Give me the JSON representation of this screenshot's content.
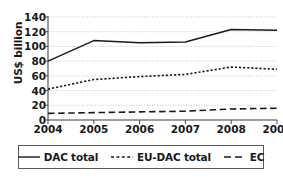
{
  "chart_data": {
    "type": "line",
    "title": "",
    "xlabel": "",
    "ylabel": "US$ billion",
    "categories": [
      "2004",
      "2005",
      "2006",
      "2007",
      "2008",
      "2009"
    ],
    "x": [
      2004,
      2005,
      2006,
      2007,
      2008,
      2009
    ],
    "ylim": [
      0,
      140
    ],
    "ytick_step": 20,
    "yticks": [
      "140",
      "120",
      "100",
      "80",
      "60",
      "40",
      "20",
      "0"
    ],
    "ytick_values": [
      140,
      120,
      100,
      80,
      60,
      40,
      20,
      0
    ],
    "grid": true,
    "grid_style": "dotted-horizontal",
    "legend_position": "bottom",
    "series": [
      {
        "name": "DAC total",
        "style": "solid",
        "color": "#1a1a1a",
        "values": [
          80,
          108,
          105,
          106,
          123,
          122
        ]
      },
      {
        "name": "EU-DAC total",
        "style": "dotted",
        "color": "#1a1a1a",
        "values": [
          42,
          55,
          59,
          62,
          72,
          69
        ]
      },
      {
        "name": "EC",
        "style": "dashed",
        "color": "#1a1a1a",
        "values": [
          9,
          10,
          11,
          12,
          15,
          16
        ]
      }
    ]
  },
  "axis": {
    "y_label": "US$ billion"
  },
  "legend": {
    "items": [
      {
        "label": "DAC total",
        "style": "solid"
      },
      {
        "label": "EU-DAC total",
        "style": "dotted"
      },
      {
        "label": "EC",
        "style": "dashed"
      }
    ]
  }
}
